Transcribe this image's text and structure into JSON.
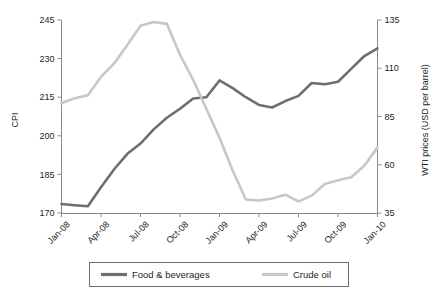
{
  "chart_data": {
    "type": "line",
    "title": "",
    "xlabel": "",
    "grid": false,
    "legend_position": "bottom-center",
    "x": [
      "Jan-08",
      "Feb-08",
      "Mar-08",
      "Apr-08",
      "May-08",
      "Jun-08",
      "Jul-08",
      "Aug-08",
      "Sep-08",
      "Oct-08",
      "Nov-08",
      "Dec-08",
      "Jan-09",
      "Feb-09",
      "Mar-09",
      "Apr-09",
      "May-09",
      "Jun-09",
      "Jul-09",
      "Aug-09",
      "Sep-09",
      "Oct-09",
      "Nov-09",
      "Dec-09",
      "Jan-10"
    ],
    "tick_labels_x": [
      "Jan-08",
      "Apr-08",
      "Jul-08",
      "Oct-08",
      "Jan-09",
      "Apr-09",
      "Jul-09",
      "Oct-09",
      "Jan-10"
    ],
    "axes": [
      {
        "id": "left",
        "label": "CPI",
        "ylim": [
          170,
          245
        ],
        "ticks": [
          170,
          185,
          200,
          215,
          230,
          245
        ],
        "tick_labels": [
          "170",
          "185",
          "200",
          "215",
          "230",
          "245"
        ]
      },
      {
        "id": "right",
        "label": "WTI prices (USD per barrel)",
        "ylim": [
          35,
          135
        ],
        "ticks": [
          35,
          60,
          85,
          110,
          135
        ],
        "tick_labels": [
          "35",
          "60",
          "85",
          "110",
          "135"
        ]
      }
    ],
    "series": [
      {
        "name": "Food & beverages",
        "axis": "left",
        "color": "#6d6e71",
        "values": [
          173.5,
          173.0,
          172.6,
          180.0,
          187.0,
          193.0,
          197.0,
          202.5,
          207.0,
          210.5,
          214.5,
          215.0,
          221.5,
          218.5,
          215.0,
          212.0,
          211.0,
          213.5,
          215.5,
          220.5,
          220.0,
          221.0,
          226.0,
          231.0,
          234.0
        ]
      },
      {
        "name": "Crude oil",
        "axis": "right",
        "color": "#c6c7c8",
        "values": [
          92.0,
          94.5,
          96.0,
          105.5,
          112.5,
          122.0,
          132.0,
          134.0,
          133.0,
          117.0,
          104.0,
          89.0,
          74.0,
          57.0,
          42.0,
          41.5,
          42.5,
          44.5,
          41.0,
          44.0,
          50.0,
          52.0,
          53.5,
          59.5,
          69.0
        ]
      }
    ],
    "series_extended": {
      "note": "Monthly observations Jan-2008 through Jan-2010 (25 points)",
      "food_beverages_tail": [
        232.5,
        235.0,
        238.0,
        240.0,
        243.5,
        241.0,
        243.0
      ],
      "crude_oil_tail": [
        66.0,
        70.0,
        72.0,
        75.0,
        74.0,
        73.5,
        76.0
      ]
    }
  },
  "legend": {
    "items": [
      {
        "label": "Food & beverages",
        "color": "#6d6e71"
      },
      {
        "label": "Crude oil",
        "color": "#c6c7c8"
      }
    ]
  },
  "axis_titles": {
    "left": "CPI",
    "right": "WTI prices (USD per barrel)"
  }
}
